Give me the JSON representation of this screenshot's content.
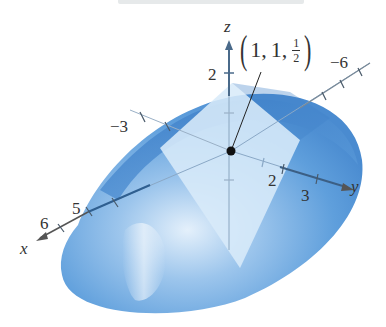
{
  "figure": {
    "surface_color": "#5b9bd8",
    "surface_dark": "#3d7fc4",
    "plane_color": "#d6e9f8",
    "axis_color": "#555555"
  },
  "axes": {
    "z": {
      "label": "z",
      "ticks": [
        {
          "value": "2"
        }
      ]
    },
    "y": {
      "label": "y",
      "ticks": [
        {
          "value": "2"
        },
        {
          "value": "3"
        }
      ],
      "negative_ticks": [
        {
          "value": "−6"
        }
      ]
    },
    "x": {
      "label": "x",
      "ticks": [
        {
          "value": "5"
        },
        {
          "value": "6"
        }
      ],
      "negative_ticks": [
        {
          "value": "−3"
        }
      ]
    }
  },
  "point": {
    "label_open": "(",
    "label_x": "1",
    "sep1": ",",
    "label_y": "1",
    "sep2": ",",
    "label_z_num": "1",
    "label_z_den": "2",
    "label_close": ")"
  }
}
